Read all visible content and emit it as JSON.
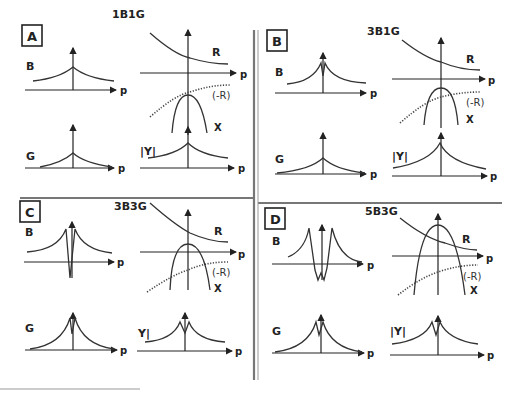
{
  "figure": {
    "panels": [
      {
        "id": "A",
        "letter": "A",
        "title": "1B1G",
        "labels": {
          "B": "B",
          "G": "G",
          "Y": "|Y|",
          "R": "R",
          "negR": "(-R)",
          "X": "X",
          "p": "p"
        }
      },
      {
        "id": "B",
        "letter": "B",
        "title": "3B1G",
        "labels": {
          "B": "B",
          "G": "G",
          "Y": "|Y|",
          "R": "R",
          "negR": "(-R)",
          "X": "X",
          "p": "p"
        }
      },
      {
        "id": "C",
        "letter": "C",
        "title": "3B3G",
        "labels": {
          "B": "B",
          "G": "G",
          "Y": "Y|",
          "R": "R",
          "negR": "(-R)",
          "X": "X",
          "p": "p"
        }
      },
      {
        "id": "D",
        "letter": "D",
        "title": "5B3G",
        "labels": {
          "B": "B",
          "G": "G",
          "Y": "|Y|",
          "R": "R",
          "negR": "(-R)",
          "X": "X",
          "p": "p"
        }
      }
    ]
  },
  "colors": {
    "ink": "#222222",
    "divider": "#777777",
    "background": "#ffffff"
  }
}
